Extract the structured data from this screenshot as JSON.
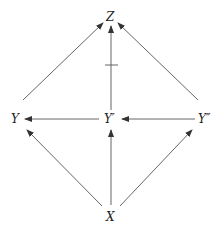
{
  "diagram": {
    "type": "directed-graph",
    "nodes": [
      {
        "id": "Z",
        "label": "Z"
      },
      {
        "id": "Y",
        "label": "Y"
      },
      {
        "id": "Yp",
        "label": "Y′"
      },
      {
        "id": "Ypp",
        "label": "Y″"
      },
      {
        "id": "X",
        "label": "X"
      }
    ],
    "edges": [
      {
        "from": "Y",
        "to": "Z"
      },
      {
        "from": "Yp",
        "to": "Z",
        "marked": true
      },
      {
        "from": "Ypp",
        "to": "Z"
      },
      {
        "from": "Yp",
        "to": "Y"
      },
      {
        "from": "Ypp",
        "to": "Yp"
      },
      {
        "from": "X",
        "to": "Y"
      },
      {
        "from": "X",
        "to": "Yp"
      },
      {
        "from": "X",
        "to": "Ypp"
      }
    ],
    "colors": {
      "line": "#555555",
      "text": "#222222"
    }
  }
}
